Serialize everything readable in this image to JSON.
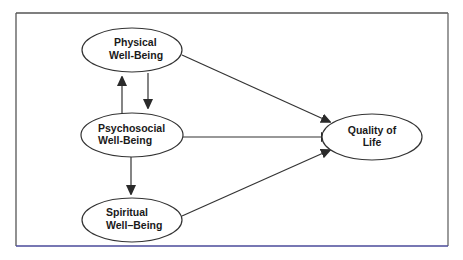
{
  "diagram": {
    "nodes": [
      {
        "id": "physical",
        "line1": "Physical",
        "line2": "Well-Being",
        "cx": 132,
        "cy": 50,
        "rx": 50,
        "ry": 22
      },
      {
        "id": "psychosocial",
        "line1": "Psychosocial",
        "line2": "Well-Being",
        "cx": 132,
        "cy": 135,
        "rx": 51,
        "ry": 22
      },
      {
        "id": "spiritual",
        "line1": "Spiritual",
        "line2": "Well–Being",
        "cx": 132,
        "cy": 220,
        "rx": 50,
        "ry": 22
      },
      {
        "id": "quality",
        "line1": "Quality of",
        "line2": "Life",
        "cx": 372,
        "cy": 137,
        "rx": 50,
        "ry": 23
      }
    ],
    "edges": [
      {
        "from": "psychosocial",
        "to": "physical",
        "label": "psychosocial-to-physical"
      },
      {
        "from": "physical",
        "to": "psychosocial",
        "label": "physical-to-psychosocial"
      },
      {
        "from": "psychosocial",
        "to": "spiritual",
        "label": "psychosocial-to-spiritual"
      },
      {
        "from": "physical",
        "to": "quality",
        "label": "physical-to-quality"
      },
      {
        "from": "psychosocial",
        "to": "quality",
        "label": "psychosocial-to-quality"
      },
      {
        "from": "spiritual",
        "to": "quality",
        "label": "spiritual-to-quality"
      }
    ],
    "colors": {
      "stroke": "#333333",
      "frame": "#555555",
      "frame_bottom": "#4a4a9a",
      "text": "#1a1a1a",
      "dash_accent": "#c0392b"
    }
  }
}
